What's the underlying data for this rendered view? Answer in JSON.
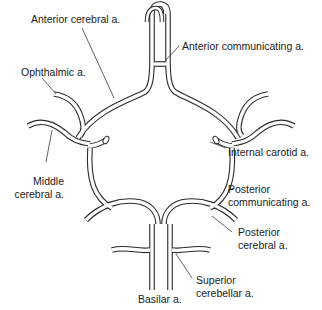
{
  "diagram": {
    "labels": {
      "anterior_cerebral": "Anterior cerebral a.",
      "anterior_communicating": "Anterior communicating a.",
      "ophthalmic": "Ophthalmic a.",
      "internal_carotid": "Internal carotid a.",
      "middle_cerebral_line1": "Middle",
      "middle_cerebral_line2": "cerebral a.",
      "posterior_communicating_line1": "Posterior",
      "posterior_communicating_line2": "communicating a.",
      "posterior_cerebral_line1": "Posterior",
      "posterior_cerebral_line2": "cerebral a.",
      "superior_cerebellar_line1": "Superior",
      "superior_cerebellar_line2": "cerebellar a.",
      "basilar": "Basilar a."
    },
    "colors": {
      "stroke": "#2a2a2a",
      "fill": "#ffffff",
      "text": "#1a1a1a"
    }
  }
}
